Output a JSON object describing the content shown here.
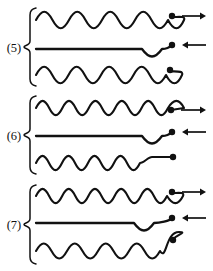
{
  "figure": {
    "title": "",
    "width": 213,
    "height": 271,
    "background_color": "#ffffff",
    "ink_color": "#111111"
  },
  "groups": [
    {
      "label": "(5)",
      "label_x": 14,
      "label_y": 52,
      "brace": {
        "x": 30,
        "top": 8,
        "bottom": 86
      },
      "rows": [
        {
          "name": "incident-wave",
          "type": "sine",
          "y": 20,
          "x_start": 36,
          "x_end": 168,
          "cycles": 4,
          "amplitude": 11,
          "phase": "crest-first",
          "tail": "rise-to-dot",
          "dot": {
            "x": 172,
            "y": 16,
            "r": 3.2
          },
          "arrow": {
            "direction": "right",
            "x1": 182,
            "x2": 206,
            "y": 16
          }
        },
        {
          "name": "transmitted-line",
          "type": "flat-with-trough",
          "y": 49,
          "x_start": 36,
          "x_end": 168,
          "cycles": 0,
          "amplitude": 10,
          "phase": "flat",
          "tail": "trough-to-dot",
          "dot": {
            "x": 172,
            "y": 45,
            "r": 3.2
          },
          "arrow": {
            "direction": "left",
            "x1": 206,
            "x2": 182,
            "y": 45
          }
        },
        {
          "name": "reflected-wave",
          "type": "sine",
          "y": 75,
          "x_start": 36,
          "x_end": 166,
          "cycles": 4,
          "amplitude": 11,
          "phase": "crest-first",
          "tail": "rise-to-dot",
          "dot": {
            "x": 170,
            "y": 70,
            "r": 3.2
          },
          "arrow": null
        }
      ]
    },
    {
      "label": "(6)",
      "label_x": 14,
      "label_y": 140,
      "brace": {
        "x": 30,
        "top": 96,
        "bottom": 174
      },
      "rows": [
        {
          "name": "incident-wave",
          "type": "sine",
          "y": 108,
          "x_start": 36,
          "x_end": 168,
          "cycles": 5,
          "amplitude": 9.5,
          "phase": "crest-first",
          "tail": "fall-to-dot",
          "dot": {
            "x": 171,
            "y": 110,
            "r": 3.2
          },
          "arrow": {
            "direction": "right",
            "x1": 181,
            "x2": 206,
            "y": 110
          }
        },
        {
          "name": "transmitted-line",
          "type": "flat-with-trough",
          "y": 136,
          "x_start": 36,
          "x_end": 168,
          "cycles": 0,
          "amplitude": 10,
          "phase": "flat",
          "tail": "trough-to-dot",
          "dot": {
            "x": 172,
            "y": 132,
            "r": 3.2
          },
          "arrow": {
            "direction": "left",
            "x1": 206,
            "x2": 182,
            "y": 132
          }
        },
        {
          "name": "reflected-wave",
          "type": "sine-with-straight-tail",
          "y": 163,
          "x_start": 36,
          "x_end": 140,
          "cycles": 4,
          "amplitude": 9.5,
          "phase": "crest-first",
          "tail": "straight-to-dot",
          "dot": {
            "x": 173,
            "y": 157,
            "r": 3.2
          },
          "arrow": null
        }
      ]
    },
    {
      "label": "(7)",
      "label_x": 14,
      "label_y": 229,
      "brace": {
        "x": 30,
        "top": 185,
        "bottom": 264
      },
      "rows": [
        {
          "name": "incident-wave",
          "type": "sine",
          "y": 196,
          "x_start": 36,
          "x_end": 167,
          "cycles": 5,
          "amplitude": 9.5,
          "phase": "crest-first",
          "tail": "rise-to-dot",
          "dot": {
            "x": 172,
            "y": 192,
            "r": 3.2
          },
          "arrow": {
            "direction": "right",
            "x1": 182,
            "x2": 206,
            "y": 192
          }
        },
        {
          "name": "transmitted-line",
          "type": "flat-with-trough",
          "y": 223,
          "x_start": 36,
          "x_end": 160,
          "cycles": 0,
          "amplitude": 10,
          "phase": "flat",
          "tail": "trough-to-dot",
          "dot": {
            "x": 172,
            "y": 218,
            "r": 3.2
          },
          "arrow": {
            "direction": "left",
            "x1": 206,
            "x2": 182,
            "y": 218
          }
        },
        {
          "name": "reflected-wave",
          "type": "sine-tall-final-peak",
          "y": 251,
          "x_start": 36,
          "x_end": 160,
          "cycles": 4,
          "amplitude": 10,
          "phase": "crest-first",
          "tail": "tall-peak-to-dot",
          "dot": {
            "x": 173,
            "y": 240,
            "r": 3.2
          },
          "arrow": null
        }
      ]
    }
  ]
}
